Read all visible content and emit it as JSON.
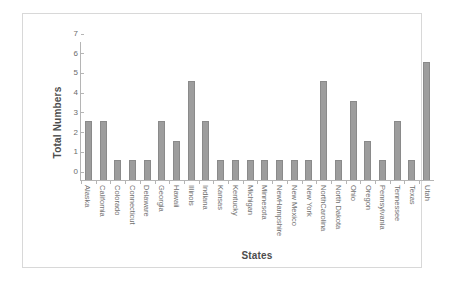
{
  "chart_data": {
    "type": "bar",
    "title": "",
    "xlabel": "States",
    "ylabel": "Total Numbers",
    "ylim": [
      0,
      7
    ],
    "yticks": [
      0,
      1,
      2,
      3,
      4,
      5,
      6,
      7
    ],
    "grid": false,
    "legend": false,
    "bar_color": "#9d9d9d",
    "bar_edge_color": "#8a8a8a",
    "axis_color": "#b5b5b5",
    "categories": [
      "Alaska",
      "California",
      "Colorado",
      "Connecticut",
      "Delaware",
      "Georgia",
      "Hawaii",
      "Illinois",
      "Indiana",
      "Kansas",
      "Kentucky",
      "Michigan",
      "Minnesota",
      "NewHampshire",
      "New Mexico",
      "New York",
      "NorthCarolina",
      "North Dakota",
      "Ohio",
      "Oregon",
      "Pennsylvania",
      "Tennessee",
      "Texas",
      "Utah"
    ],
    "values": [
      3,
      3,
      1,
      1,
      1,
      3,
      2,
      5,
      3,
      1,
      1,
      1,
      1,
      1,
      1,
      1,
      5,
      1,
      4,
      2,
      1,
      3,
      1,
      6
    ]
  }
}
